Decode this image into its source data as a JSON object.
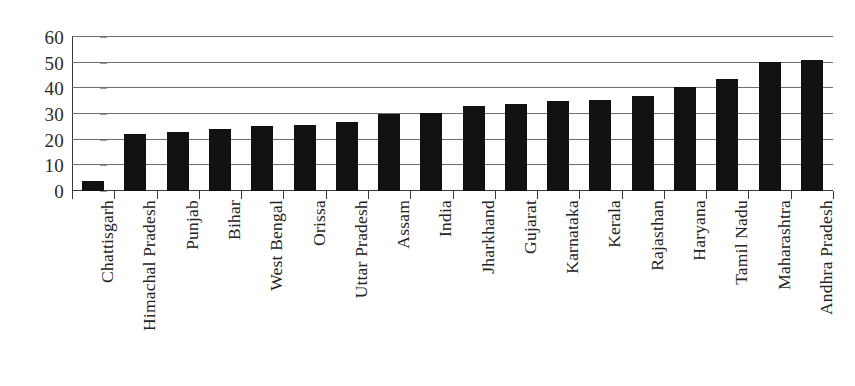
{
  "chart_data": {
    "type": "bar",
    "title": "",
    "subtitle": "",
    "xlabel": "",
    "ylabel": "",
    "ylim": [
      0,
      60
    ],
    "yticks": [
      0,
      10,
      20,
      30,
      40,
      50,
      60
    ],
    "grid": true,
    "legend": null,
    "orientation": "vertical",
    "bar_color": "#111111",
    "categories": [
      "Chattisgarh",
      "Himachal Pradesh",
      "Punjab",
      "Bihar",
      "West Bengal",
      "Orissa",
      "Uttar Pradesh",
      "Assam",
      "India",
      "Jharkhand",
      "Gujarat",
      "Karnataka",
      "Kerala",
      "Rajasthan",
      "Haryana",
      "Tamil Nadu",
      "Maharashtra",
      "Andhra Pradesh"
    ],
    "values": [
      4,
      22.3,
      22.8,
      24,
      25.3,
      25.8,
      27,
      30,
      30.5,
      33.2,
      34,
      35.2,
      35.3,
      37,
      40.5,
      43.6,
      50.4,
      51.2
    ]
  },
  "axis": {
    "y_tick_labels": [
      "60",
      "50",
      "40",
      "30",
      "20",
      "10",
      "0"
    ]
  }
}
